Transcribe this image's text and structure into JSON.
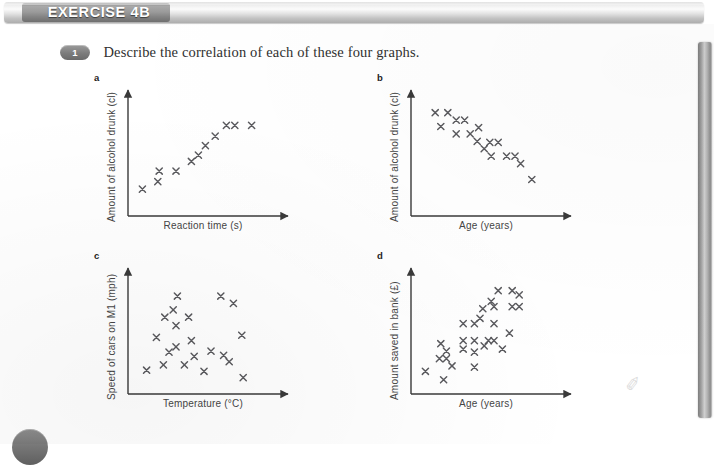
{
  "header": {
    "exercise_title": "EXERCISE 4B"
  },
  "question": {
    "number": "1",
    "text": "Describe the correlation of each of these four graphs."
  },
  "page_furniture": {
    "right_edge_bar": "page-edge-shadow",
    "page_number_badge": "page-number-circle",
    "scan_artifact": "✐"
  },
  "chart_data": [
    {
      "id": "graph-a",
      "letter": "a",
      "type": "scatter",
      "title": "",
      "xlabel": "Reaction time (s)",
      "ylabel": "Amount of alcohol drunk (cl)",
      "xlim": [
        0,
        100
      ],
      "ylim": [
        0,
        100
      ],
      "grid": false,
      "legend": "none",
      "correlation": "positive",
      "points": [
        {
          "x": 6,
          "y": 16
        },
        {
          "x": 17,
          "y": 23
        },
        {
          "x": 18,
          "y": 33
        },
        {
          "x": 30,
          "y": 33
        },
        {
          "x": 41,
          "y": 42
        },
        {
          "x": 46,
          "y": 48
        },
        {
          "x": 51,
          "y": 57
        },
        {
          "x": 58,
          "y": 66
        },
        {
          "x": 66,
          "y": 76
        },
        {
          "x": 72,
          "y": 76
        },
        {
          "x": 84,
          "y": 76
        }
      ]
    },
    {
      "id": "graph-b",
      "letter": "b",
      "type": "scatter",
      "title": "",
      "xlabel": "Age (years)",
      "ylabel": "Amount of alcohol drunk (cl)",
      "xlim": [
        0,
        100
      ],
      "ylim": [
        0,
        100
      ],
      "grid": false,
      "legend": "none",
      "correlation": "negative",
      "points": [
        {
          "x": 13,
          "y": 88
        },
        {
          "x": 22,
          "y": 88
        },
        {
          "x": 28,
          "y": 81
        },
        {
          "x": 34,
          "y": 81
        },
        {
          "x": 17,
          "y": 75
        },
        {
          "x": 28,
          "y": 68
        },
        {
          "x": 38,
          "y": 68
        },
        {
          "x": 44,
          "y": 74
        },
        {
          "x": 43,
          "y": 61
        },
        {
          "x": 52,
          "y": 60
        },
        {
          "x": 58,
          "y": 60
        },
        {
          "x": 48,
          "y": 54
        },
        {
          "x": 53,
          "y": 47
        },
        {
          "x": 64,
          "y": 47
        },
        {
          "x": 70,
          "y": 47
        },
        {
          "x": 74,
          "y": 40
        },
        {
          "x": 82,
          "y": 25
        }
      ]
    },
    {
      "id": "graph-c",
      "letter": "c",
      "type": "scatter",
      "title": "",
      "xlabel": "Temperature (°C)",
      "ylabel": "Speed of cars on M1 (mph)",
      "xlim": [
        0,
        100
      ],
      "ylim": [
        0,
        100
      ],
      "grid": false,
      "legend": "none",
      "correlation": "none",
      "points": [
        {
          "x": 9,
          "y": 13
        },
        {
          "x": 21,
          "y": 18
        },
        {
          "x": 16,
          "y": 44
        },
        {
          "x": 22,
          "y": 63
        },
        {
          "x": 31,
          "y": 83
        },
        {
          "x": 30,
          "y": 55
        },
        {
          "x": 30,
          "y": 35
        },
        {
          "x": 28,
          "y": 70
        },
        {
          "x": 25,
          "y": 30
        },
        {
          "x": 36,
          "y": 18
        },
        {
          "x": 39,
          "y": 63
        },
        {
          "x": 41,
          "y": 41
        },
        {
          "x": 43,
          "y": 26
        },
        {
          "x": 50,
          "y": 12
        },
        {
          "x": 55,
          "y": 31
        },
        {
          "x": 62,
          "y": 83
        },
        {
          "x": 64,
          "y": 27
        },
        {
          "x": 68,
          "y": 21
        },
        {
          "x": 71,
          "y": 76
        },
        {
          "x": 77,
          "y": 46
        },
        {
          "x": 78,
          "y": 6
        }
      ]
    },
    {
      "id": "graph-d",
      "letter": "d",
      "type": "scatter",
      "title": "",
      "xlabel": "Age (years)",
      "ylabel": "Amount saved in bank (£)",
      "xlim": [
        0,
        100
      ],
      "ylim": [
        0,
        100
      ],
      "grid": false,
      "legend": "none",
      "correlation": "positive",
      "points": [
        {
          "x": 6,
          "y": 12
        },
        {
          "x": 19,
          "y": 4
        },
        {
          "x": 17,
          "y": 38
        },
        {
          "x": 21,
          "y": 31
        },
        {
          "x": 16,
          "y": 24
        },
        {
          "x": 21,
          "y": 24
        },
        {
          "x": 25,
          "y": 17
        },
        {
          "x": 33,
          "y": 57
        },
        {
          "x": 33,
          "y": 41
        },
        {
          "x": 33,
          "y": 33
        },
        {
          "x": 41,
          "y": 57
        },
        {
          "x": 41,
          "y": 41
        },
        {
          "x": 41,
          "y": 30
        },
        {
          "x": 41,
          "y": 16
        },
        {
          "x": 45,
          "y": 62
        },
        {
          "x": 47,
          "y": 71
        },
        {
          "x": 48,
          "y": 36
        },
        {
          "x": 51,
          "y": 41
        },
        {
          "x": 55,
          "y": 41
        },
        {
          "x": 53,
          "y": 78
        },
        {
          "x": 55,
          "y": 57
        },
        {
          "x": 55,
          "y": 73
        },
        {
          "x": 58,
          "y": 88
        },
        {
          "x": 61,
          "y": 33
        },
        {
          "x": 66,
          "y": 48
        },
        {
          "x": 68,
          "y": 73
        },
        {
          "x": 73,
          "y": 73
        },
        {
          "x": 68,
          "y": 88
        },
        {
          "x": 73,
          "y": 84
        }
      ]
    }
  ]
}
